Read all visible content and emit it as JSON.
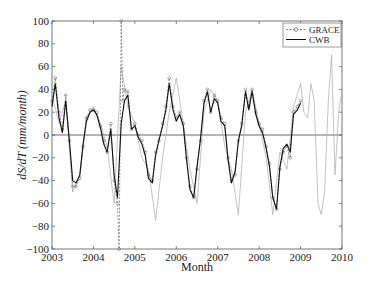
{
  "chart_data": {
    "type": "line",
    "title": "",
    "xlabel": "Month",
    "ylabel": "dS/dT (mm/month)",
    "xlim": [
      2003,
      2010
    ],
    "ylim": [
      -100,
      100
    ],
    "xticks": [
      "2003",
      "2004",
      "2005",
      "2006",
      "2007",
      "2008",
      "2009",
      "2010"
    ],
    "yticks": [
      "100",
      "80",
      "60",
      "40",
      "20",
      "0",
      "−20",
      "−40",
      "−60",
      "−80",
      "−100"
    ],
    "grid": false,
    "zero_line": true,
    "legend_position": "upper right",
    "legend": [
      "GRACE",
      "CWB"
    ],
    "series": [
      {
        "name": "GRACE",
        "style": "dashed gray with circle markers",
        "x": [
          2003.0,
          2003.08,
          2003.17,
          2003.25,
          2003.33,
          2003.42,
          2003.5,
          2003.58,
          2003.67,
          2003.75,
          2003.83,
          2003.92,
          2004.0,
          2004.08,
          2004.17,
          2004.25,
          2004.33,
          2004.42,
          2004.5,
          2004.58,
          2004.62,
          2004.67,
          2004.71,
          2004.75,
          2004.83,
          2004.92,
          2005.0,
          2005.08,
          2005.17,
          2005.25,
          2005.33,
          2005.42,
          2005.5,
          2005.58,
          2005.67,
          2005.75,
          2005.83,
          2005.92,
          2006.0,
          2006.08,
          2006.17,
          2006.25,
          2006.33,
          2006.42,
          2006.5,
          2006.58,
          2006.67,
          2006.75,
          2006.83,
          2006.92,
          2007.0,
          2007.08,
          2007.17,
          2007.25,
          2007.33,
          2007.42,
          2007.5,
          2007.58,
          2007.67,
          2007.75,
          2007.83,
          2007.92,
          2008.0,
          2008.08,
          2008.17,
          2008.25,
          2008.33,
          2008.42,
          2008.5,
          2008.58,
          2008.67,
          2008.75,
          2008.83,
          2008.92,
          2009.0
        ],
        "values": [
          30,
          50,
          20,
          5,
          35,
          -5,
          -45,
          -45,
          -38,
          -10,
          15,
          22,
          22,
          20,
          8,
          -5,
          -15,
          10,
          -40,
          -60,
          -100,
          100,
          30,
          40,
          38,
          5,
          10,
          0,
          -5,
          -15,
          -35,
          -40,
          -15,
          -5,
          10,
          25,
          50,
          25,
          15,
          20,
          10,
          -20,
          -45,
          -55,
          -30,
          -5,
          30,
          40,
          20,
          35,
          30,
          15,
          10,
          -20,
          -40,
          -35,
          -5,
          10,
          40,
          25,
          40,
          20,
          10,
          5,
          -10,
          -25,
          -55,
          -65,
          -30,
          -15,
          -10,
          -20,
          20,
          25,
          30
        ]
      },
      {
        "name": "CWB",
        "style": "solid black",
        "x": [
          2003.0,
          2003.08,
          2003.17,
          2003.25,
          2003.33,
          2003.42,
          2003.5,
          2003.58,
          2003.67,
          2003.75,
          2003.83,
          2003.92,
          2004.0,
          2004.08,
          2004.17,
          2004.25,
          2004.33,
          2004.42,
          2004.5,
          2004.58,
          2004.67,
          2004.75,
          2004.83,
          2004.92,
          2005.0,
          2005.08,
          2005.17,
          2005.25,
          2005.33,
          2005.42,
          2005.5,
          2005.58,
          2005.67,
          2005.75,
          2005.83,
          2005.92,
          2006.0,
          2006.08,
          2006.17,
          2006.25,
          2006.33,
          2006.42,
          2006.5,
          2006.58,
          2006.67,
          2006.75,
          2006.83,
          2006.92,
          2007.0,
          2007.08,
          2007.17,
          2007.25,
          2007.33,
          2007.42,
          2007.5,
          2007.58,
          2007.67,
          2007.75,
          2007.83,
          2007.92,
          2008.0,
          2008.08,
          2008.17,
          2008.25,
          2008.33,
          2008.42,
          2008.5,
          2008.58,
          2008.67,
          2008.75,
          2008.83,
          2008.92,
          2009.0
        ],
        "values": [
          25,
          45,
          15,
          2,
          30,
          -5,
          -40,
          -42,
          -35,
          -8,
          12,
          20,
          22,
          18,
          6,
          -8,
          -15,
          5,
          -35,
          -55,
          10,
          30,
          35,
          5,
          8,
          -2,
          -8,
          -18,
          -38,
          -42,
          -18,
          -5,
          8,
          22,
          45,
          22,
          12,
          18,
          8,
          -22,
          -48,
          -55,
          -28,
          -5,
          28,
          38,
          20,
          32,
          28,
          12,
          8,
          -22,
          -42,
          -32,
          -5,
          8,
          38,
          22,
          38,
          18,
          8,
          2,
          -12,
          -28,
          -55,
          -65,
          -28,
          -12,
          -8,
          -15,
          18,
          22,
          28
        ]
      },
      {
        "name": "Model (thin gray)",
        "style": "thin solid light gray",
        "x": [
          2003.0,
          2003.17,
          2003.33,
          2003.5,
          2003.67,
          2003.83,
          2004.0,
          2004.17,
          2004.33,
          2004.5,
          2004.67,
          2004.83,
          2005.0,
          2005.17,
          2005.33,
          2005.5,
          2005.67,
          2005.83,
          2006.0,
          2006.17,
          2006.33,
          2006.5,
          2006.67,
          2006.83,
          2007.0,
          2007.17,
          2007.33,
          2007.5,
          2007.67,
          2007.83,
          2008.0,
          2008.17,
          2008.33,
          2008.5,
          2008.67,
          2008.83,
          2009.0,
          2009.08,
          2009.17,
          2009.25,
          2009.33,
          2009.42,
          2009.5,
          2009.58,
          2009.67,
          2009.75,
          2009.83,
          2009.92,
          2010.0
        ],
        "values": [
          35,
          10,
          30,
          -50,
          -35,
          15,
          25,
          10,
          -10,
          -60,
          60,
          25,
          10,
          -20,
          -30,
          -75,
          -20,
          20,
          50,
          10,
          -30,
          -60,
          20,
          40,
          30,
          -10,
          -30,
          -70,
          20,
          40,
          10,
          -20,
          -70,
          -15,
          -30,
          25,
          45,
          20,
          15,
          45,
          30,
          -60,
          -70,
          -50,
          30,
          70,
          -35,
          20,
          40
        ]
      }
    ]
  }
}
